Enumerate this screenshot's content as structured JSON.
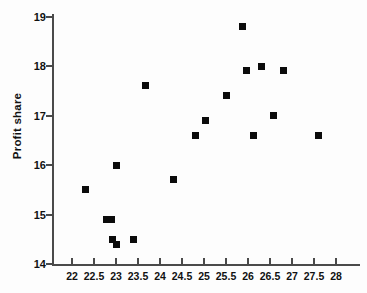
{
  "chart_data": {
    "type": "scatter",
    "title": "",
    "xlabel": "",
    "ylabel": "Profit share",
    "xlim": [
      21.6,
      28.3
    ],
    "ylim": [
      14,
      19
    ],
    "grid": false,
    "legend": null,
    "xticks": [
      22,
      22.5,
      23,
      23.5,
      24,
      24.5,
      25,
      25.5,
      26,
      26.5,
      27,
      27.5,
      28
    ],
    "xtick_labels": [
      "22",
      "22.5",
      "23",
      "23.5",
      "24",
      "24.5",
      "25",
      "25.5",
      "26",
      "26.5",
      "27",
      "27.5",
      "28"
    ],
    "yticks": [
      14,
      15,
      16,
      17,
      18,
      19
    ],
    "ytick_labels": [
      "14",
      "15",
      "16",
      "17",
      "18",
      "19"
    ],
    "marker": "square",
    "marker_color": "#0b0b0b",
    "points": [
      {
        "x": 22.3,
        "y": 15.5
      },
      {
        "x": 22.78,
        "y": 14.9
      },
      {
        "x": 22.9,
        "y": 14.9
      },
      {
        "x": 22.92,
        "y": 14.5
      },
      {
        "x": 23.0,
        "y": 16.0
      },
      {
        "x": 23.02,
        "y": 14.4
      },
      {
        "x": 23.4,
        "y": 14.5
      },
      {
        "x": 23.68,
        "y": 17.6
      },
      {
        "x": 24.3,
        "y": 15.7
      },
      {
        "x": 24.8,
        "y": 16.6
      },
      {
        "x": 25.03,
        "y": 16.9
      },
      {
        "x": 25.5,
        "y": 17.4
      },
      {
        "x": 25.88,
        "y": 18.8
      },
      {
        "x": 25.97,
        "y": 17.9
      },
      {
        "x": 26.12,
        "y": 16.6
      },
      {
        "x": 26.3,
        "y": 18.0
      },
      {
        "x": 26.58,
        "y": 17.0
      },
      {
        "x": 26.8,
        "y": 17.9
      },
      {
        "x": 27.6,
        "y": 16.6
      }
    ]
  }
}
